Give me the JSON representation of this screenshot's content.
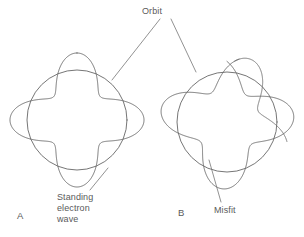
{
  "figure": {
    "type": "scientific-diagram",
    "background_color": "#ffffff",
    "stroke_color": "#666666",
    "text_color": "#5a5a5a",
    "width": 304,
    "height": 237
  },
  "labels": {
    "orbit": "Orbit",
    "standing_wave_line1": "Standing",
    "standing_wave_line2": "electron",
    "standing_wave_line3": "wave",
    "misfit": "Misfit"
  },
  "panels": [
    {
      "letter": "A",
      "center_x": 77,
      "center_y": 120,
      "orbit_radius": 50,
      "wave_lobes": 4,
      "wave_amplitude": 17,
      "wave_closes": true,
      "description": "Standing electron wave fits the orbit exactly"
    },
    {
      "letter": "B",
      "center_x": 227,
      "center_y": 122,
      "orbit_radius": 50,
      "wave_lobes": 3.65,
      "wave_amplitude": 17,
      "wave_closes": false,
      "description": "Standing electron wave does not fit: ends fail to meet"
    }
  ],
  "leaders": {
    "orbit_to_a": "V-shaped leader from the Orbit label down-left to panel A orbit circle",
    "orbit_to_b": "V-shaped leader from the Orbit label down-right to panel B orbit circle",
    "standing_wave": "leader from the Standing electron wave label up-right to panel A lower lobe",
    "misfit": "leader from the Misfit label up-left to the open end in panel B"
  }
}
